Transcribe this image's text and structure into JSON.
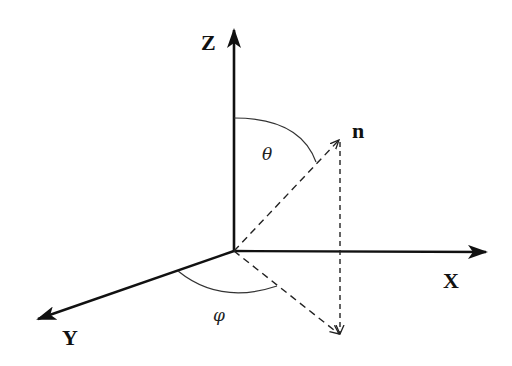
{
  "diagram": {
    "axes": {
      "z": {
        "label": "Z"
      },
      "x": {
        "label": "X"
      },
      "y": {
        "label": "Y"
      }
    },
    "vector": {
      "label": "n"
    },
    "angles": {
      "polar": {
        "label": "θ"
      },
      "azimuthal": {
        "label": "φ"
      }
    },
    "colors": {
      "stroke": "#111111",
      "background": "#ffffff"
    }
  }
}
